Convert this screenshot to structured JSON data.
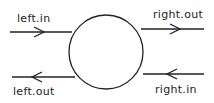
{
  "diagram": {
    "node": {
      "shape": "circle",
      "label": ""
    },
    "ports": [
      {
        "id": "left_in",
        "label": "left.in",
        "side": "left",
        "direction": "in"
      },
      {
        "id": "left_out",
        "label": "left.out",
        "side": "left",
        "direction": "out"
      },
      {
        "id": "right_out",
        "label": "right.out",
        "side": "right",
        "direction": "out"
      },
      {
        "id": "right_in",
        "label": "right.in",
        "side": "right",
        "direction": "in"
      }
    ],
    "colors": {
      "stroke": "#222222",
      "background": "#ffffff"
    }
  }
}
